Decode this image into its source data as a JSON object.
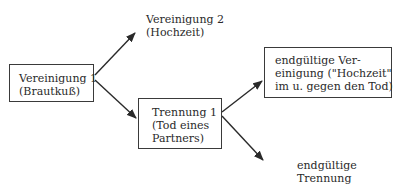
{
  "diagram": {
    "nodes": {
      "union1": {
        "line1": "Vereinigung 1",
        "line2": "(Brautkuß)"
      },
      "union2": {
        "line1": "Vereinigung 2",
        "line2": "(Hochzeit)"
      },
      "separation1": {
        "line1": "Trennung 1",
        "line2": "(Tod eines",
        "line3": "Partners)"
      },
      "final_union": {
        "line1": "endgültige Ver-",
        "line2": "einigung (\"Hochzeit\"",
        "line3": "im u. gegen den Tod)"
      },
      "final_separation": {
        "line1": "endgültige",
        "line2": "Trennung"
      }
    },
    "edges": [
      {
        "from": "union1",
        "to": "union2"
      },
      {
        "from": "union1",
        "to": "separation1"
      },
      {
        "from": "separation1",
        "to": "final_union"
      },
      {
        "from": "separation1",
        "to": "final_separation"
      }
    ],
    "colors": {
      "stroke": "#2a2a2a",
      "background": "#ffffff"
    }
  }
}
